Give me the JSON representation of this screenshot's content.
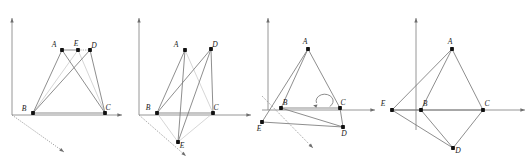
{
  "figure": {
    "width": 532,
    "height": 162,
    "colors": {
      "edge": "#7a7a7a",
      "edge_light": "#cfcfcf",
      "axis": "#8a8a8a",
      "vertex": "#111111",
      "label": "#1a1a1a",
      "background": "#ffffff"
    },
    "panels": [
      {
        "id": "panel-1",
        "caption": "",
        "origin": [
          12,
          115
        ],
        "axes": [
          {
            "name": "y-axis",
            "from": [
              12,
              115
            ],
            "to": [
              12,
              18
            ],
            "style": "solid",
            "arrow": true
          },
          {
            "name": "x-axis",
            "from": [
              12,
              115
            ],
            "to": [
              122,
              115
            ],
            "style": "solid",
            "arrow": true
          },
          {
            "name": "z-axis",
            "from": [
              12,
              115
            ],
            "to": [
              64,
              152
            ],
            "style": "dotted",
            "arrow": true
          }
        ],
        "vertices": [
          {
            "name": "A",
            "x": 62,
            "y": 50,
            "label": "A",
            "label_dx": -8,
            "label_dy": -3
          },
          {
            "name": "E",
            "x": 78,
            "y": 50,
            "label": "E",
            "label_dx": -2,
            "label_dy": -4
          },
          {
            "name": "B",
            "x": 33,
            "y": 113,
            "label": "B",
            "label_dx": -9,
            "label_dy": -2
          },
          {
            "name": "C",
            "x": 105,
            "y": 113,
            "label": "C",
            "label_dx": 3,
            "label_dy": -3
          },
          {
            "name": "D",
            "x": 90,
            "y": 50,
            "label": "D",
            "label_dx": 4,
            "label_dy": -2
          }
        ],
        "edges": [
          {
            "from": "A",
            "to": "B",
            "style": "solid"
          },
          {
            "from": "A",
            "to": "E",
            "style": "solid"
          },
          {
            "from": "A",
            "to": "C",
            "style": "solid"
          },
          {
            "from": "B",
            "to": "C",
            "style": "solid"
          },
          {
            "from": "B",
            "to": "D",
            "style": "solid"
          },
          {
            "from": "D",
            "to": "C",
            "style": "solid"
          },
          {
            "from": "E",
            "to": "D",
            "style": "dotted"
          },
          {
            "from": "E",
            "to": "C",
            "style": "light"
          },
          {
            "from": "B",
            "to": "E",
            "style": "light"
          }
        ]
      },
      {
        "id": "panel-2",
        "caption": "",
        "origin": [
          139,
          115
        ],
        "axes": [
          {
            "name": "y-axis",
            "from": [
              139,
              115
            ],
            "to": [
              139,
              18
            ],
            "style": "solid",
            "arrow": true
          },
          {
            "name": "x-axis",
            "from": [
              139,
              115
            ],
            "to": [
              251,
              115
            ],
            "style": "solid",
            "arrow": true
          },
          {
            "name": "z-axis",
            "from": [
              139,
              115
            ],
            "to": [
              186,
              156
            ],
            "style": "dotted",
            "arrow": true
          }
        ],
        "vertices": [
          {
            "name": "A",
            "x": 185,
            "y": 50,
            "label": "A",
            "label_dx": -9,
            "label_dy": -3
          },
          {
            "name": "D",
            "x": 211,
            "y": 49,
            "label": "D",
            "label_dx": 4,
            "label_dy": -2
          },
          {
            "name": "B",
            "x": 157,
            "y": 113,
            "label": "B",
            "label_dx": -9,
            "label_dy": -3
          },
          {
            "name": "C",
            "x": 213,
            "y": 113,
            "label": "C",
            "label_dx": 3,
            "label_dy": -3
          },
          {
            "name": "E",
            "x": 178,
            "y": 142,
            "label": "E",
            "label_dx": 4,
            "label_dy": 6
          }
        ],
        "edges": [
          {
            "from": "A",
            "to": "B",
            "style": "solid"
          },
          {
            "from": "A",
            "to": "E",
            "style": "solid"
          },
          {
            "from": "A",
            "to": "C",
            "style": "light"
          },
          {
            "from": "B",
            "to": "C",
            "style": "solid"
          },
          {
            "from": "B",
            "to": "D",
            "style": "solid"
          },
          {
            "from": "B",
            "to": "E",
            "style": "light"
          },
          {
            "from": "D",
            "to": "C",
            "style": "solid"
          },
          {
            "from": "D",
            "to": "E",
            "style": "solid"
          },
          {
            "from": "E",
            "to": "C",
            "style": "light"
          }
        ]
      },
      {
        "id": "panel-3",
        "caption": "",
        "origin": [
          268,
          110
        ],
        "axes": [
          {
            "name": "y-axis",
            "from": [
              268,
              110
            ],
            "to": [
              268,
              18
            ],
            "style": "solid",
            "arrow": true
          },
          {
            "name": "x-axis",
            "from": [
              262,
              110
            ],
            "to": [
              375,
              110
            ],
            "style": "solid",
            "arrow": true
          },
          {
            "name": "z-axis",
            "from": [
              262,
              96
            ],
            "to": [
              313,
              148
            ],
            "style": "dotted",
            "arrow": true
          }
        ],
        "vertices": [
          {
            "name": "A",
            "x": 308,
            "y": 49,
            "label": "A",
            "label_dx": -3,
            "label_dy": -5
          },
          {
            "name": "B",
            "x": 281,
            "y": 108,
            "label": "B",
            "label_dx": 4,
            "label_dy": -3
          },
          {
            "name": "C",
            "x": 340,
            "y": 108,
            "label": "C",
            "label_dx": 3,
            "label_dy": -3
          },
          {
            "name": "E",
            "x": 262,
            "y": 122,
            "label": "E",
            "label_dx": -3,
            "label_dy": 9
          },
          {
            "name": "D",
            "x": 343,
            "y": 127,
            "label": "D",
            "label_dx": 1,
            "label_dy": 9
          }
        ],
        "edges": [
          {
            "from": "A",
            "to": "B",
            "style": "solid"
          },
          {
            "from": "A",
            "to": "C",
            "style": "solid"
          },
          {
            "from": "A",
            "to": "E",
            "style": "solid"
          },
          {
            "from": "B",
            "to": "C",
            "style": "solid"
          },
          {
            "from": "B",
            "to": "D",
            "style": "solid"
          },
          {
            "from": "C",
            "to": "D",
            "style": "solid"
          },
          {
            "from": "E",
            "to": "D",
            "style": "solid"
          }
        ],
        "annotations": [
          {
            "name": "rotation-arrow",
            "type": "curved-arrow",
            "cx": 325,
            "cy": 98,
            "direction": "counterclockwise"
          }
        ]
      },
      {
        "id": "panel-4",
        "caption": "",
        "origin": [
          416,
          110
        ],
        "axes": [
          {
            "name": "y-axis",
            "from": [
              416,
              130
            ],
            "to": [
              416,
              18
            ],
            "style": "solid",
            "arrow": true
          },
          {
            "name": "x-axis",
            "from": [
              392,
              110
            ],
            "to": [
              525,
              110
            ],
            "style": "solid",
            "arrow": true
          }
        ],
        "vertices": [
          {
            "name": "A",
            "x": 452,
            "y": 49,
            "label": "A",
            "label_dx": -2,
            "label_dy": -5
          },
          {
            "name": "E",
            "x": 392,
            "y": 110,
            "label": "E",
            "label_dx": -9,
            "label_dy": -4
          },
          {
            "name": "B",
            "x": 421,
            "y": 110,
            "label": "B",
            "label_dx": 4,
            "label_dy": -4
          },
          {
            "name": "C",
            "x": 483,
            "y": 110,
            "label": "C",
            "label_dx": 4,
            "label_dy": -4
          },
          {
            "name": "D",
            "x": 453,
            "y": 148,
            "label": "D",
            "label_dx": 5,
            "label_dy": 5
          }
        ],
        "edges": [
          {
            "from": "A",
            "to": "E",
            "style": "solid"
          },
          {
            "from": "A",
            "to": "B",
            "style": "solid"
          },
          {
            "from": "A",
            "to": "C",
            "style": "solid"
          },
          {
            "from": "E",
            "to": "B",
            "style": "solid"
          },
          {
            "from": "B",
            "to": "C",
            "style": "solid"
          },
          {
            "from": "E",
            "to": "D",
            "style": "solid"
          },
          {
            "from": "B",
            "to": "D",
            "style": "solid"
          },
          {
            "from": "C",
            "to": "D",
            "style": "solid"
          }
        ]
      }
    ]
  }
}
